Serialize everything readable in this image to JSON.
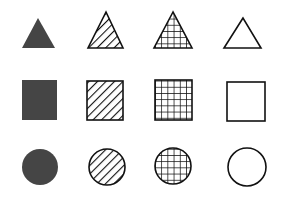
{
  "diagram": {
    "title": "",
    "layout": {
      "rows": 3,
      "columns": 4
    },
    "rows": [
      "triangle",
      "square",
      "circle"
    ],
    "columns": [
      "solid-fill",
      "diagonal-hatch",
      "grid-hatch",
      "no-fill"
    ],
    "colors": {
      "background": "#ffffff",
      "solid_fill": "#454545",
      "stroke": "#111111"
    },
    "shapes": [
      {
        "shape": "triangle",
        "fill": "solid",
        "points": "38,18 22,48 55,48"
      },
      {
        "shape": "triangle",
        "fill": "diagonal",
        "points": "106,12 88,48 123,48"
      },
      {
        "shape": "triangle",
        "fill": "grid",
        "points": "173,12 154,48 192,48"
      },
      {
        "shape": "triangle",
        "fill": "none",
        "points": "243,18 224,48 261,48"
      },
      {
        "shape": "square",
        "fill": "solid",
        "x": 22,
        "y": 80,
        "w": 35,
        "h": 40
      },
      {
        "shape": "square",
        "fill": "diagonal",
        "x": 87,
        "y": 81,
        "w": 36,
        "h": 39
      },
      {
        "shape": "square",
        "fill": "grid",
        "x": 155,
        "y": 80,
        "w": 37,
        "h": 40
      },
      {
        "shape": "square",
        "fill": "none",
        "x": 227,
        "y": 82,
        "w": 38,
        "h": 39
      },
      {
        "shape": "circle",
        "fill": "solid",
        "cx": 40,
        "cy": 167,
        "r": 18
      },
      {
        "shape": "circle",
        "fill": "diagonal",
        "cx": 107,
        "cy": 167,
        "r": 18
      },
      {
        "shape": "circle",
        "fill": "grid",
        "cx": 173,
        "cy": 166,
        "r": 18
      },
      {
        "shape": "circle",
        "fill": "none",
        "cx": 247,
        "cy": 167,
        "r": 19
      }
    ]
  }
}
